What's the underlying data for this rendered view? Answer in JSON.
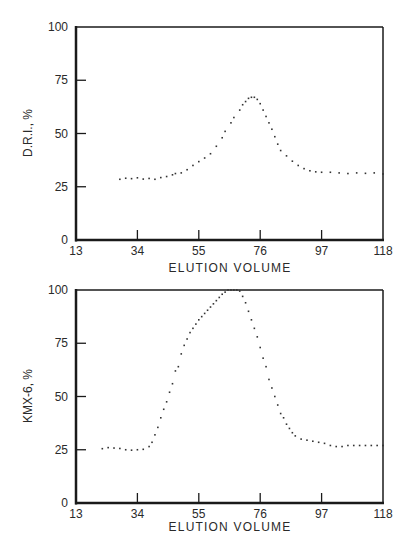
{
  "chart_data": [
    {
      "type": "scatter",
      "title": "",
      "xlabel": "ELUTION VOLUME",
      "ylabel": "D.R.I., %",
      "xlim": [
        13,
        118
      ],
      "ylim": [
        0,
        100
      ],
      "xticks": [
        13,
        34,
        55,
        76,
        97,
        118
      ],
      "yticks": [
        0,
        25,
        50,
        75,
        100
      ],
      "grid": false,
      "legend": null,
      "series": [
        {
          "name": "D.R.I.",
          "x": [
            28,
            30,
            32,
            34,
            36,
            38,
            40,
            42,
            44,
            46,
            47,
            49,
            51,
            53,
            55,
            57,
            59,
            61,
            63,
            64,
            66,
            67,
            69,
            70,
            71,
            72,
            73,
            74,
            75,
            76,
            77,
            78,
            79,
            80,
            81,
            82,
            83,
            85,
            87,
            89,
            91,
            93,
            95,
            97,
            100,
            103,
            106,
            109,
            112,
            115,
            118
          ],
          "y": [
            28.5,
            29,
            28.8,
            29.2,
            28.6,
            28.9,
            28.5,
            29.3,
            29.8,
            30.6,
            31.2,
            31.5,
            33,
            35,
            36.8,
            38.5,
            40.5,
            44,
            48,
            51,
            55,
            57.5,
            61,
            63.5,
            65,
            66.5,
            67,
            67,
            66,
            64,
            61,
            58,
            55,
            52,
            48.5,
            45,
            42,
            39.5,
            37,
            35,
            33.5,
            32.5,
            32,
            31.8,
            31.8,
            31.5,
            31.2,
            31.5,
            31.3,
            31.5,
            31
          ]
        }
      ]
    },
    {
      "type": "scatter",
      "title": "",
      "xlabel": "ELUTION VOLUME",
      "ylabel": "KMX-6, %",
      "xlim": [
        13,
        118
      ],
      "ylim": [
        0,
        100
      ],
      "xticks": [
        13,
        34,
        55,
        76,
        97,
        118
      ],
      "yticks": [
        0,
        25,
        50,
        75,
        100
      ],
      "grid": false,
      "legend": null,
      "series": [
        {
          "name": "KMX-6",
          "x": [
            22,
            24,
            26,
            28,
            30,
            32,
            34,
            36,
            38,
            39,
            40,
            41,
            42,
            43,
            44,
            45,
            46,
            47,
            48,
            49,
            50,
            51,
            52,
            53,
            54,
            55,
            56,
            57,
            58,
            59,
            60,
            61,
            62,
            63,
            64,
            65,
            66,
            67,
            68,
            69,
            70,
            71,
            72,
            73,
            74,
            75,
            76,
            77,
            78,
            79,
            80,
            81,
            82,
            83,
            84,
            85,
            86,
            87,
            88,
            90,
            92,
            94,
            96,
            98,
            100,
            102,
            104,
            106,
            108,
            110,
            112,
            114,
            116,
            118
          ],
          "y": [
            25.5,
            26,
            25.8,
            25.6,
            25,
            24.8,
            25,
            25.2,
            26.5,
            28.5,
            32,
            35.5,
            40,
            44,
            47.5,
            52,
            56,
            62,
            64,
            70,
            74,
            77,
            80,
            82,
            84,
            86,
            87.5,
            89,
            90.5,
            92,
            93.5,
            95,
            96.5,
            98,
            99,
            100,
            100,
            100,
            100,
            99.5,
            97,
            94,
            90,
            86,
            82,
            78,
            73,
            68,
            64,
            58,
            54,
            50,
            46,
            42,
            40,
            37,
            35,
            33,
            31.5,
            30,
            29.5,
            29,
            28.5,
            28,
            27,
            26.5,
            26.5,
            27,
            27,
            27,
            27,
            27,
            27,
            27
          ]
        }
      ]
    }
  ],
  "charts": [
    {
      "ylabel": "D.R.I., %",
      "xlabel": "ELUTION VOLUME",
      "xtick_labels": [
        "13",
        "34",
        "55",
        "76",
        "97",
        "118"
      ],
      "ytick_labels": [
        "0",
        "25",
        "50",
        "75",
        "100"
      ]
    },
    {
      "ylabel": "KMX-6, %",
      "xlabel": "ELUTION VOLUME",
      "xtick_labels": [
        "13",
        "34",
        "55",
        "76",
        "97",
        "118"
      ],
      "ytick_labels": [
        "0",
        "25",
        "50",
        "75",
        "100"
      ]
    }
  ],
  "colors": {
    "axis": "#1a1a1a",
    "points": "#333333",
    "text": "#2a2a2a",
    "background": "#ffffff"
  }
}
